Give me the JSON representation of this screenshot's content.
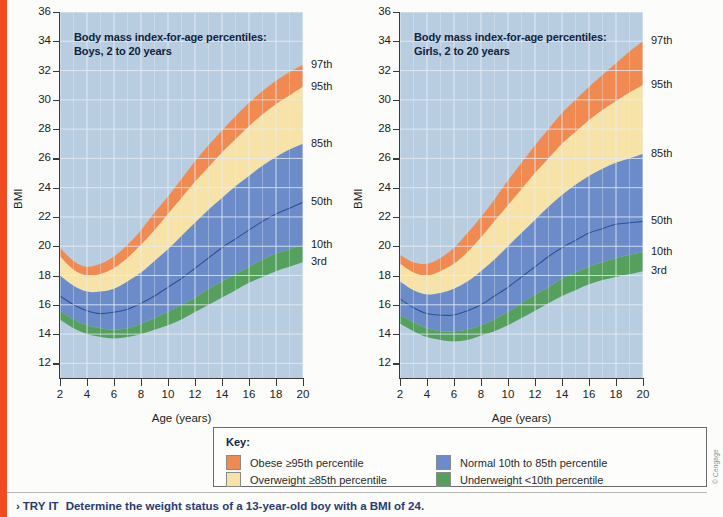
{
  "page": {
    "accent_bar_color": "#f04a23",
    "background": "#fcfcfa",
    "copyright": "© Cengage"
  },
  "footer": {
    "chevron": "›",
    "label": "TRY IT",
    "prompt": "Determine the weight status of a 13-year-old boy with a BMI of 24."
  },
  "key": {
    "title": "Key:",
    "items": [
      {
        "label": "Obese ≥95th percentile",
        "color": "#f08a50",
        "name": "obese"
      },
      {
        "label": "Overweight ≥85th percentile",
        "color": "#f7e2a8",
        "name": "overweight"
      },
      {
        "label": "Normal 10th to 85th percentile",
        "color": "#6b8cc8",
        "name": "normal"
      },
      {
        "label": "Underweight <10th percentile",
        "color": "#55a05c",
        "name": "underweight"
      }
    ]
  },
  "colors": {
    "plot_background": "#b9cde1",
    "gridline": "#e8eff7",
    "band_obese": "#f08a50",
    "band_overweight": "#f7e2a8",
    "band_normal": "#6b8cc8",
    "band_underweight": "#55a05c",
    "band_outside": "#b9cde1",
    "median_line": "#2f4f9b",
    "axis": "#3a3a3a"
  },
  "chart_data": [
    {
      "type": "area",
      "name": "boys",
      "title": "Body mass index-for-age percentiles:\nBoys, 2 to 20 years",
      "xlabel": "Age (years)",
      "ylabel": "BMI",
      "xlim": [
        2,
        20
      ],
      "ylim": [
        11,
        36
      ],
      "xticks": [
        2,
        4,
        6,
        8,
        10,
        12,
        14,
        16,
        18,
        20
      ],
      "yticks": [
        12,
        14,
        16,
        18,
        20,
        22,
        24,
        26,
        28,
        30,
        32,
        34,
        36
      ],
      "grid": true,
      "legend_position": "right-outside",
      "x": [
        2,
        3,
        4,
        5,
        6,
        7,
        8,
        9,
        10,
        11,
        12,
        13,
        14,
        15,
        16,
        17,
        18,
        19,
        20
      ],
      "series": [
        {
          "name": "3rd",
          "label": "3rd",
          "values": [
            15.0,
            14.4,
            14.0,
            13.8,
            13.7,
            13.8,
            14.0,
            14.3,
            14.6,
            15.0,
            15.5,
            16.0,
            16.5,
            17.0,
            17.5,
            17.9,
            18.3,
            18.6,
            18.9
          ]
        },
        {
          "name": "10th",
          "label": "10th",
          "values": [
            15.6,
            15.0,
            14.6,
            14.4,
            14.3,
            14.4,
            14.7,
            15.1,
            15.5,
            16.0,
            16.5,
            17.1,
            17.6,
            18.1,
            18.6,
            19.1,
            19.5,
            19.8,
            20.1
          ]
        },
        {
          "name": "50th",
          "label": "50th",
          "values": [
            16.6,
            16.0,
            15.6,
            15.4,
            15.5,
            15.7,
            16.1,
            16.6,
            17.2,
            17.8,
            18.5,
            19.2,
            19.9,
            20.5,
            21.1,
            21.7,
            22.2,
            22.6,
            23.0
          ]
        },
        {
          "name": "85th",
          "label": "85th",
          "values": [
            18.0,
            17.3,
            16.9,
            16.9,
            17.1,
            17.6,
            18.2,
            19.0,
            19.8,
            20.7,
            21.6,
            22.5,
            23.3,
            24.1,
            24.8,
            25.5,
            26.1,
            26.6,
            27.0
          ]
        },
        {
          "name": "95th",
          "label": "95th",
          "values": [
            19.3,
            18.4,
            18.0,
            18.1,
            18.5,
            19.2,
            20.1,
            21.1,
            22.2,
            23.3,
            24.4,
            25.4,
            26.4,
            27.3,
            28.2,
            29.0,
            29.7,
            30.3,
            30.9
          ]
        },
        {
          "name": "97th",
          "label": "97th",
          "values": [
            19.9,
            19.0,
            18.6,
            18.8,
            19.3,
            20.1,
            21.1,
            22.3,
            23.4,
            24.6,
            25.8,
            26.9,
            27.9,
            28.9,
            29.8,
            30.6,
            31.3,
            31.9,
            32.4
          ]
        }
      ]
    },
    {
      "type": "area",
      "name": "girls",
      "title": "Body mass index-for-age percentiles:\nGirls, 2 to 20 years",
      "xlabel": "Age (years)",
      "ylabel": "BMI",
      "xlim": [
        2,
        20
      ],
      "ylim": [
        11,
        36
      ],
      "xticks": [
        2,
        4,
        6,
        8,
        10,
        12,
        14,
        16,
        18,
        20
      ],
      "yticks": [
        12,
        14,
        16,
        18,
        20,
        22,
        24,
        26,
        28,
        30,
        32,
        34,
        36
      ],
      "grid": true,
      "legend_position": "right-outside",
      "x": [
        2,
        3,
        4,
        5,
        6,
        7,
        8,
        9,
        10,
        11,
        12,
        13,
        14,
        15,
        16,
        17,
        18,
        19,
        20
      ],
      "series": [
        {
          "name": "3rd",
          "label": "3rd",
          "values": [
            14.7,
            14.2,
            13.8,
            13.6,
            13.5,
            13.6,
            13.9,
            14.2,
            14.6,
            15.1,
            15.6,
            16.1,
            16.6,
            17.0,
            17.4,
            17.7,
            17.9,
            18.1,
            18.3
          ]
        },
        {
          "name": "10th",
          "label": "10th",
          "values": [
            15.3,
            14.8,
            14.4,
            14.2,
            14.2,
            14.3,
            14.6,
            15.0,
            15.5,
            16.1,
            16.7,
            17.2,
            17.8,
            18.2,
            18.6,
            18.9,
            19.2,
            19.4,
            19.6
          ]
        },
        {
          "name": "50th",
          "label": "50th",
          "values": [
            16.4,
            15.8,
            15.4,
            15.3,
            15.3,
            15.6,
            16.0,
            16.6,
            17.2,
            17.9,
            18.6,
            19.3,
            19.9,
            20.4,
            20.9,
            21.2,
            21.5,
            21.6,
            21.7
          ]
        },
        {
          "name": "85th",
          "label": "85th",
          "values": [
            17.6,
            17.0,
            16.7,
            16.8,
            17.1,
            17.6,
            18.3,
            19.1,
            20.0,
            20.9,
            21.8,
            22.7,
            23.5,
            24.2,
            24.8,
            25.3,
            25.7,
            26.0,
            26.3
          ]
        },
        {
          "name": "95th",
          "label": "95th",
          "values": [
            18.8,
            18.2,
            18.0,
            18.3,
            18.8,
            19.6,
            20.6,
            21.7,
            22.8,
            23.9,
            25.0,
            26.0,
            27.0,
            27.8,
            28.6,
            29.3,
            29.9,
            30.5,
            31.0
          ]
        },
        {
          "name": "97th",
          "label": "97th",
          "values": [
            19.4,
            18.9,
            18.8,
            19.2,
            19.9,
            20.9,
            22.0,
            23.2,
            24.5,
            25.7,
            26.9,
            28.0,
            29.1,
            30.0,
            30.9,
            31.7,
            32.5,
            33.3,
            34.0
          ]
        }
      ]
    }
  ]
}
